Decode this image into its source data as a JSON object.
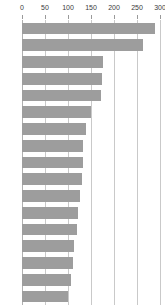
{
  "chart_data": {
    "type": "bar",
    "orientation": "horizontal",
    "title": "",
    "subtitle": "",
    "xlabel": "",
    "ylabel": "",
    "xlim": [
      0,
      300
    ],
    "ylim": null,
    "grid": true,
    "grid_axis": "x",
    "legend": false,
    "legend_position": "none",
    "axis_position": "top",
    "bar_color": "#9d9d9d",
    "gridline_color": "#c9c9c9",
    "tick_label_color": "#3b3b3b",
    "background_color": "#ffffff",
    "xticks": [
      0,
      50,
      100,
      150,
      200,
      250,
      300
    ],
    "xtick_labels": [
      "0",
      "50",
      "100",
      "150",
      "200",
      "250",
      "300"
    ],
    "categories": [
      "",
      "",
      "",
      "",
      "",
      "",
      "",
      "",
      "",
      "",
      "",
      "",
      "",
      "",
      "",
      "",
      ""
    ],
    "values": [
      290,
      264,
      176,
      173,
      172,
      150,
      140,
      133,
      133,
      131,
      125,
      122,
      119,
      113,
      110,
      106,
      100
    ]
  }
}
